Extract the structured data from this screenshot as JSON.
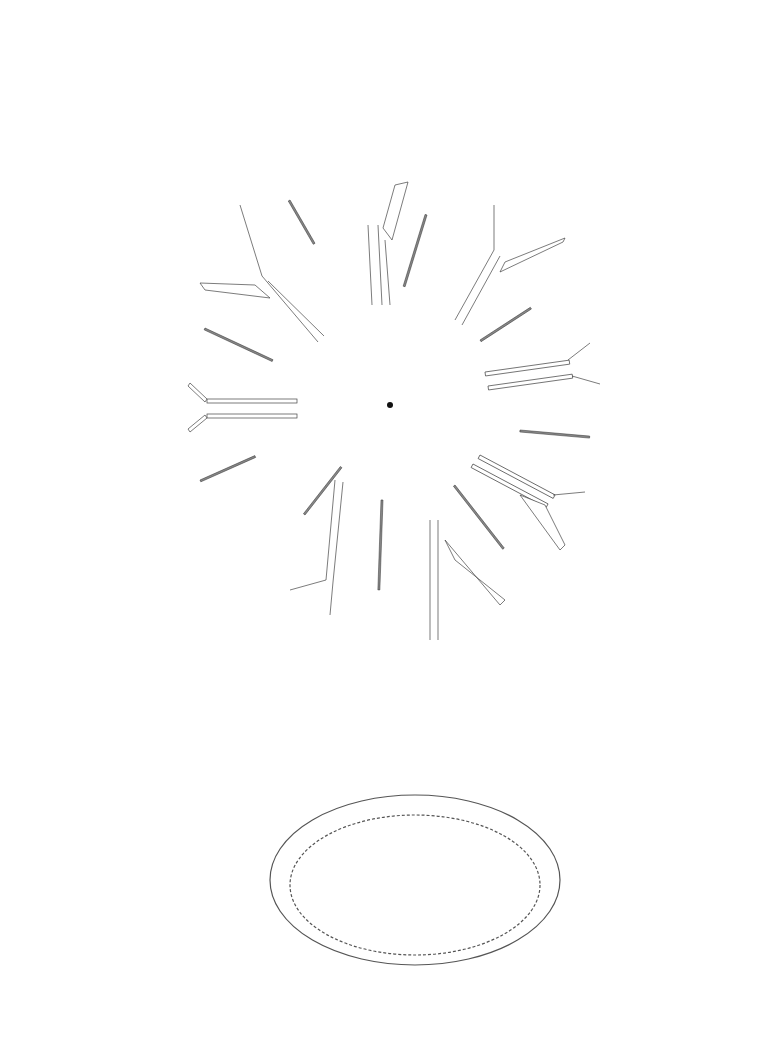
{
  "plan": {
    "title": "RAKER PLAN",
    "center": [
      390,
      405
    ],
    "rakers": [
      {
        "id": "R1",
        "pos": [
          32,
          410
        ],
        "type": ""
      },
      {
        "id": "R2",
        "pos": [
          56,
          276
        ],
        "type": "B"
      },
      {
        "id": "R3",
        "pos": [
          124,
          157
        ],
        "type": ""
      },
      {
        "id": "R4",
        "pos": [
          230,
          73
        ],
        "type": "B"
      },
      {
        "id": "R5",
        "pos": [
          354,
          33
        ],
        "type": ""
      },
      {
        "id": "R6",
        "pos": [
          482,
          60
        ],
        "type": "B"
      },
      {
        "id": "R7",
        "pos": [
          610,
          33
        ],
        "type": ""
      },
      {
        "id": "R8",
        "pos": [
          700,
          200
        ],
        "type": "B"
      },
      {
        "id": "R9",
        "pos": [
          737,
          331
        ],
        "type": ""
      },
      {
        "id": "R10",
        "pos": [
          739,
          462
        ],
        "type": "B"
      },
      {
        "id": "R11",
        "pos": [
          709,
          594
        ],
        "type": ""
      },
      {
        "id": "R12",
        "pos": [
          622,
          700
        ],
        "type": "B"
      },
      {
        "id": "R13",
        "pos": [
          504,
          765
        ],
        "type": ""
      },
      {
        "id": "R14",
        "pos": [
          373,
          765
        ],
        "type": "B"
      },
      {
        "id": "R15",
        "pos": [
          246,
          752
        ],
        "type": ""
      },
      {
        "id": "R16",
        "pos": [
          136,
          676
        ],
        "type": "B"
      },
      {
        "id": "R17",
        "pos": [
          55,
          518
        ],
        "type": "B"
      }
    ],
    "splays": [
      {
        "id": "1a",
        "pos": [
          120,
          482
        ],
        "type": "C",
        "from": [
          200,
          420
        ]
      },
      {
        "id": "1b",
        "pos": [
          120,
          338
        ],
        "type": "C",
        "from": [
          200,
          398
        ]
      },
      {
        "id": "3a",
        "pos": [
          144,
          273
        ],
        "type": "A",
        "from": [
          265,
          290
        ]
      },
      {
        "id": "3b",
        "pos": [
          237,
          167
        ],
        "type": "C",
        "from": [
          265,
          275
        ]
      },
      {
        "id": "5a",
        "pos": [
          296,
          134
        ],
        "type": "C",
        "from": [
          370,
          222
        ]
      },
      {
        "id": "5b",
        "pos": [
          432,
          118
        ],
        "type": "A",
        "from": [
          385,
          230
        ]
      },
      {
        "id": "7a",
        "pos": [
          498,
          136
        ],
        "type": "C",
        "from": [
          495,
          250
        ]
      },
      {
        "id": "7b",
        "pos": [
          610,
          219
        ],
        "type": "A",
        "from": [
          510,
          245
        ]
      },
      {
        "id": "9a",
        "pos": [
          647,
          277
        ],
        "type": "C",
        "from": [
          575,
          345
        ]
      },
      {
        "id": "9b",
        "pos": [
          652,
          417
        ],
        "type": "C",
        "from": [
          575,
          370
        ]
      },
      {
        "id": "11a",
        "pos": [
          666,
          486
        ],
        "type": "C",
        "from": [
          555,
          492
        ]
      },
      {
        "id": "11b",
        "pos": [
          596,
          610
        ],
        "type": "A",
        "from": [
          560,
          545
        ]
      },
      {
        "id": "13a",
        "pos": [
          542,
          655
        ],
        "type": "A",
        "from": [
          455,
          570
        ]
      },
      {
        "id": "13b",
        "pos": [
          411,
          699
        ],
        "type": "A",
        "from": [
          435,
          580
        ]
      },
      {
        "id": "15a",
        "pos": [
          344,
          696
        ],
        "type": "C",
        "from": [
          330,
          580
        ]
      },
      {
        "id": "15b",
        "pos": [
          219,
          638
        ],
        "type": "C",
        "from": [
          290,
          580
        ]
      }
    ]
  },
  "legend": {
    "items": [
      {
        "key": "A",
        "label": "concrete raker splayed"
      },
      {
        "key": "B",
        "label": "steel raker straight"
      },
      {
        "key": "C",
        "label": "steel raker splayed"
      }
    ]
  },
  "axonometric": {
    "caption_line1": "AXONOMETRIC SHOWING CONCRETE",
    "caption_line2": "AND STEEL RAKERS"
  },
  "page": {
    "number": "60"
  },
  "colors": {
    "line": "#555555",
    "background": "#ffffff",
    "text": "#1a1a1a"
  }
}
